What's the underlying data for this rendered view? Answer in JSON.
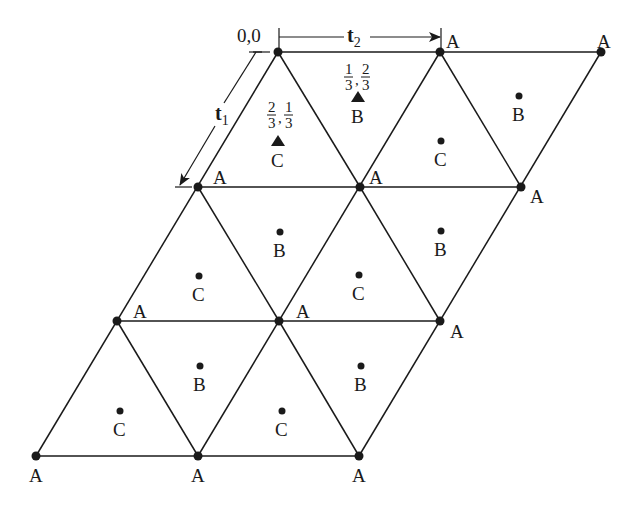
{
  "diagram": {
    "origin_label": "0,0",
    "vectors": {
      "t1": {
        "main": "t",
        "sub": "1"
      },
      "t2": {
        "main": "t",
        "sub": "2"
      }
    },
    "fractions": {
      "B": {
        "a_num": "1",
        "a_den": "3",
        "b_num": "2",
        "b_den": "3"
      },
      "C": {
        "a_num": "2",
        "a_den": "3",
        "b_num": "1",
        "b_den": "3"
      }
    },
    "site_labels": {
      "A": "A",
      "B": "B",
      "C": "C"
    },
    "lattice_vertices": [
      {
        "row": 0,
        "points": [
          [
            278,
            52
          ],
          [
            440,
            52
          ],
          [
            601,
            52
          ]
        ]
      },
      {
        "row": 1,
        "points": [
          [
            198,
            187
          ],
          [
            360,
            187
          ],
          [
            521,
            187
          ]
        ]
      },
      {
        "row": 2,
        "points": [
          [
            117,
            321
          ],
          [
            279,
            321
          ],
          [
            440,
            321
          ]
        ]
      },
      {
        "row": 3,
        "points": [
          [
            36,
            456
          ],
          [
            198,
            456
          ],
          [
            359,
            456
          ]
        ]
      }
    ],
    "a_labels": [
      {
        "x": 452,
        "y": 44,
        "text": "A"
      },
      {
        "x": 604,
        "y": 44,
        "text": "A"
      },
      {
        "x": 215,
        "y": 184,
        "text": "A"
      },
      {
        "x": 372,
        "y": 184,
        "text": "A"
      },
      {
        "x": 530,
        "y": 200,
        "text": "A"
      },
      {
        "x": 133,
        "y": 318,
        "text": "A"
      },
      {
        "x": 298,
        "y": 318,
        "text": "A"
      },
      {
        "x": 450,
        "y": 336,
        "text": "A"
      },
      {
        "x": 36,
        "y": 481,
        "text": "A"
      },
      {
        "x": 198,
        "y": 481,
        "text": "A"
      },
      {
        "x": 359,
        "y": 481,
        "text": "A"
      }
    ],
    "b_sites": [
      {
        "x": 519,
        "y": 96,
        "lx": 519,
        "ly": 121
      },
      {
        "x": 280,
        "y": 232,
        "lx": 280,
        "ly": 256
      },
      {
        "x": 441,
        "y": 231,
        "lx": 441,
        "ly": 255
      },
      {
        "x": 200,
        "y": 366,
        "lx": 200,
        "ly": 390
      },
      {
        "x": 361,
        "y": 366,
        "lx": 361,
        "ly": 390
      }
    ],
    "c_sites": [
      {
        "x": 441,
        "y": 141,
        "lx": 441,
        "ly": 166
      },
      {
        "x": 199,
        "y": 276,
        "lx": 199,
        "ly": 301
      },
      {
        "x": 359,
        "y": 275,
        "lx": 359,
        "ly": 300
      },
      {
        "x": 120,
        "y": 411,
        "lx": 120,
        "ly": 436
      },
      {
        "x": 282,
        "y": 411,
        "lx": 282,
        "ly": 436
      }
    ],
    "triangle_marker_sites": [
      {
        "site": "B",
        "x": 358,
        "y": 96,
        "lx": 358,
        "ly": 122
      },
      {
        "site": "C",
        "x": 278,
        "y": 141,
        "lx": 278,
        "ly": 166
      }
    ],
    "colors": {
      "ink": "#1a1a1a",
      "background": "#ffffff"
    }
  }
}
